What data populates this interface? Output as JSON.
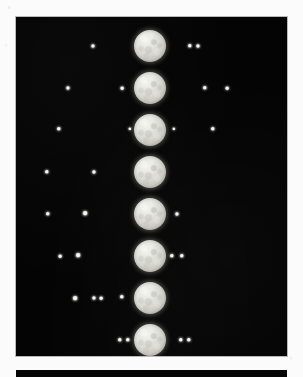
{
  "page": {
    "background_color": "#fbfbfb",
    "width": 303,
    "height": 377,
    "caption": ""
  },
  "plate": {
    "name": "photographic-plate",
    "background_color": "#040404",
    "border_color": "#b9b9b9",
    "left": 16,
    "top": 17,
    "width": 271,
    "height": 339
  },
  "bottom_strip": {
    "background_color": "#050505",
    "left": 16,
    "top": 370,
    "width": 271,
    "height": 7
  },
  "planet": {
    "label": "planet-disk",
    "diameter": 32,
    "center_x": 150,
    "highlight_color": "#f4f4f0",
    "shadow_color": "#8a8a82"
  },
  "satellite": {
    "label": "satellite-dot",
    "color": "#ffffff"
  },
  "chart_data": {
    "type": "scatter",
    "title": "",
    "subtitle": "",
    "xlabel": "",
    "ylabel": "",
    "xlim": [
      16,
      287
    ],
    "ylim": [
      17,
      356
    ],
    "grid": false,
    "legend": "none",
    "series": [
      {
        "name": "planet",
        "points": [
          {
            "x": 150,
            "y": 46,
            "size": 32
          },
          {
            "x": 150,
            "y": 88,
            "size": 32
          },
          {
            "x": 150,
            "y": 130,
            "size": 32
          },
          {
            "x": 150,
            "y": 172,
            "size": 32
          },
          {
            "x": 150,
            "y": 214,
            "size": 32
          },
          {
            "x": 150,
            "y": 256,
            "size": 32
          },
          {
            "x": 150,
            "y": 298,
            "size": 32
          },
          {
            "x": 150,
            "y": 340,
            "size": 32
          }
        ]
      },
      {
        "name": "satellites",
        "points": [
          {
            "x": 93,
            "y": 46,
            "size": 2.4
          },
          {
            "x": 190,
            "y": 46,
            "size": 2.6
          },
          {
            "x": 198,
            "y": 46,
            "size": 2.4
          },
          {
            "x": 68,
            "y": 88,
            "size": 2.4
          },
          {
            "x": 122,
            "y": 88,
            "size": 2.2
          },
          {
            "x": 205,
            "y": 88,
            "size": 2.6
          },
          {
            "x": 227,
            "y": 88,
            "size": 2.2
          },
          {
            "x": 59,
            "y": 129,
            "size": 2.6
          },
          {
            "x": 130,
            "y": 129,
            "size": 2.0
          },
          {
            "x": 174,
            "y": 129,
            "size": 2.0
          },
          {
            "x": 213,
            "y": 129,
            "size": 2.6
          },
          {
            "x": 47,
            "y": 172,
            "size": 2.6
          },
          {
            "x": 94,
            "y": 172,
            "size": 2.4
          },
          {
            "x": 48,
            "y": 214,
            "size": 2.6
          },
          {
            "x": 85,
            "y": 213,
            "size": 2.8
          },
          {
            "x": 177,
            "y": 214,
            "size": 2.4
          },
          {
            "x": 60,
            "y": 256,
            "size": 2.2
          },
          {
            "x": 78,
            "y": 255,
            "size": 2.8
          },
          {
            "x": 172,
            "y": 256,
            "size": 2.6
          },
          {
            "x": 182,
            "y": 256,
            "size": 2.6
          },
          {
            "x": 75,
            "y": 298,
            "size": 2.8
          },
          {
            "x": 94,
            "y": 298,
            "size": 2.4
          },
          {
            "x": 101,
            "y": 298,
            "size": 2.2
          },
          {
            "x": 122,
            "y": 297,
            "size": 2.6
          },
          {
            "x": 120,
            "y": 340,
            "size": 2.6
          },
          {
            "x": 128,
            "y": 340,
            "size": 2.6
          },
          {
            "x": 181,
            "y": 340,
            "size": 2.6
          },
          {
            "x": 189,
            "y": 340,
            "size": 2.6
          }
        ]
      }
    ],
    "rows": [
      {
        "index": 1,
        "planet_y": 46,
        "satellites_left": 1,
        "satellites_right": 2
      },
      {
        "index": 2,
        "planet_y": 88,
        "satellites_left": 2,
        "satellites_right": 2
      },
      {
        "index": 3,
        "planet_y": 129,
        "satellites_left": 2,
        "satellites_right": 2
      },
      {
        "index": 4,
        "planet_y": 172,
        "satellites_left": 2,
        "satellites_right": 0
      },
      {
        "index": 5,
        "planet_y": 214,
        "satellites_left": 2,
        "satellites_right": 1
      },
      {
        "index": 6,
        "planet_y": 256,
        "satellites_left": 2,
        "satellites_right": 2
      },
      {
        "index": 7,
        "planet_y": 298,
        "satellites_left": 4,
        "satellites_right": 0
      },
      {
        "index": 8,
        "planet_y": 340,
        "satellites_left": 2,
        "satellites_right": 2
      }
    ]
  }
}
